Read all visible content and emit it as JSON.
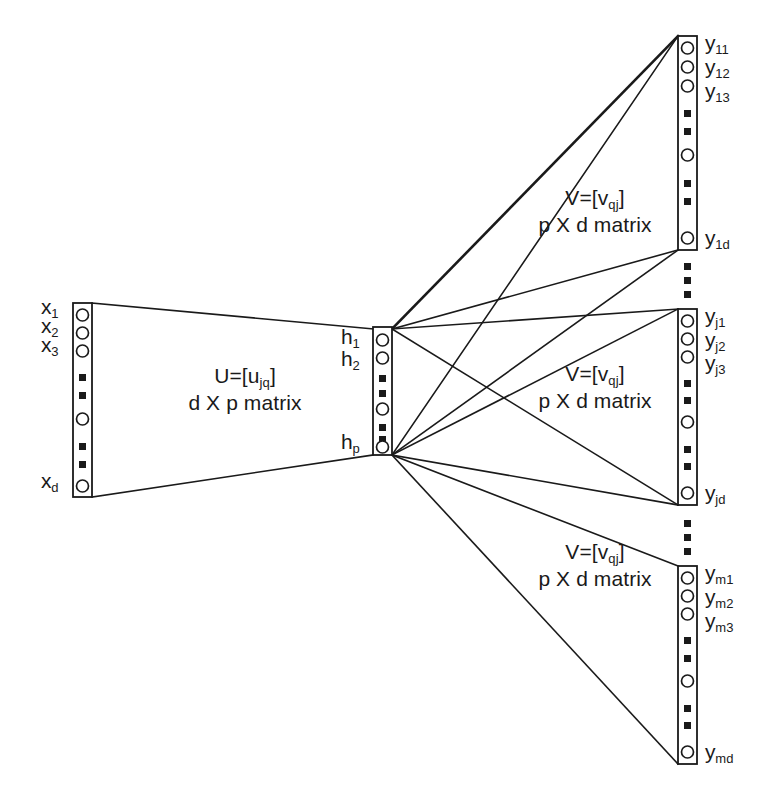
{
  "diagram": {
    "stroke_color": "#1a1a1a",
    "background_color": "#ffffff",
    "layers": {
      "input": {
        "name": "input-layer",
        "labels": [
          {
            "base": "x",
            "sub": "1"
          },
          {
            "base": "x",
            "sub": "2"
          },
          {
            "base": "x",
            "sub": "3"
          },
          {
            "base": "x",
            "sub": "d"
          }
        ],
        "node_pattern": [
          "circle",
          "circle",
          "circle",
          "square",
          "square",
          "circle",
          "square",
          "square",
          "circle"
        ]
      },
      "hidden": {
        "name": "hidden-layer",
        "labels": [
          {
            "base": "h",
            "sub": "1"
          },
          {
            "base": "h",
            "sub": "2"
          },
          {
            "base": "h",
            "sub": "p"
          }
        ],
        "node_pattern": [
          "circle",
          "circle",
          "square",
          "square",
          "circle",
          "square",
          "square",
          "circle"
        ]
      },
      "output_groups": [
        {
          "name": "output-group-1",
          "labels": [
            {
              "base": "y",
              "sub": "11"
            },
            {
              "base": "y",
              "sub": "12"
            },
            {
              "base": "y",
              "sub": "13"
            },
            {
              "base": "y",
              "sub": "1d"
            }
          ],
          "node_pattern": [
            "circle",
            "circle",
            "circle",
            "square",
            "square",
            "circle",
            "square",
            "square",
            "circle"
          ]
        },
        {
          "name": "output-group-j",
          "labels": [
            {
              "base": "y",
              "sub": "j1"
            },
            {
              "base": "y",
              "sub": "j2"
            },
            {
              "base": "y",
              "sub": "j3"
            },
            {
              "base": "y",
              "sub": "jd"
            }
          ],
          "node_pattern": [
            "circle",
            "circle",
            "circle",
            "square",
            "square",
            "circle",
            "square",
            "square",
            "circle"
          ]
        },
        {
          "name": "output-group-m",
          "labels": [
            {
              "base": "y",
              "sub": "m1"
            },
            {
              "base": "y",
              "sub": "m2"
            },
            {
              "base": "y",
              "sub": "m3"
            },
            {
              "base": "y",
              "sub": "md"
            }
          ],
          "node_pattern": [
            "circle",
            "circle",
            "circle",
            "square",
            "square",
            "circle",
            "square",
            "square",
            "circle"
          ]
        }
      ]
    },
    "weight_blocks": {
      "u": {
        "line1_prefix": "U=[u",
        "line1_sub": "jq",
        "line1_suffix": "]",
        "line2": "d X p matrix"
      },
      "v": {
        "line1_prefix": "V=[v",
        "line1_sub": "qj",
        "line1_suffix": "]",
        "line2": "p X d matrix"
      }
    },
    "ellipsis": {
      "glyph": "square-dot",
      "between_groups_count": 3
    }
  }
}
